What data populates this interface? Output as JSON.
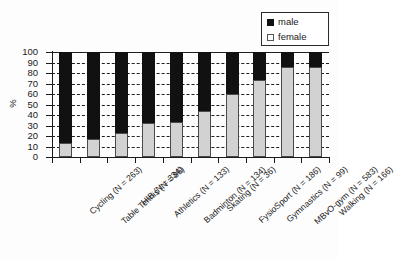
{
  "chart_data": {
    "type": "bar",
    "subtype": "stacked-percentage",
    "title": "",
    "xlabel": "",
    "ylabel": "%",
    "ylim": [
      0,
      100
    ],
    "ytick_step": 10,
    "yticks": [
      0,
      10,
      20,
      30,
      40,
      50,
      60,
      70,
      80,
      90,
      100
    ],
    "grid": true,
    "grid_style": "dashed-horizontal",
    "legend_position": "top-right",
    "categories": [
      "Cycling (N = 263)",
      "Table Tennis (N = 86)",
      "HIB (N = 334)",
      "Athletics (N = 133)",
      "Badminton (N = 134)",
      "Skating (N = 36)",
      "FysioSport (N = 186)",
      "Gymnastics (N = 99)",
      "MBvO-gym (N = 583)",
      "Walking (N = 166)"
    ],
    "series": [
      {
        "name": "female",
        "color": "#d2d2d2",
        "values": [
          13,
          17,
          23,
          32,
          33,
          44,
          60,
          73,
          86,
          86
        ]
      },
      {
        "name": "male",
        "color": "#111111",
        "values": [
          87,
          83,
          77,
          68,
          67,
          56,
          40,
          27,
          14,
          14
        ]
      }
    ]
  },
  "legend": {
    "items": [
      {
        "label": "male",
        "swatch": "black-square"
      },
      {
        "label": "female",
        "swatch": "white-square"
      }
    ]
  },
  "axis": {
    "y_title": "%"
  }
}
